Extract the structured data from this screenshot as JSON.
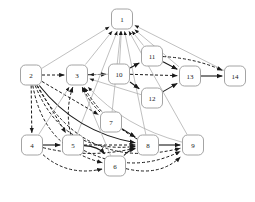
{
  "figure": {
    "title": "",
    "background": "#ffffff",
    "width": 255,
    "height": 202
  },
  "graph_data": {
    "type": "diagram",
    "kind": "directed-graph",
    "node_shape": "rounded-rectangle",
    "node_fill": "#ffffff",
    "node_stroke": "#8d8d8d",
    "node_width": 21,
    "node_height": 20,
    "node_radius": 5,
    "label_color": "#1a1a1a",
    "edge_styles": {
      "solid_dark": {
        "color": "#1a1a1a",
        "dash": "none",
        "width": 1.1
      },
      "dashed_dark": {
        "color": "#1a1a1a",
        "dash": "3,2",
        "width": 1.0
      },
      "solid_gray": {
        "color": "#b0b0b0",
        "dash": "none",
        "width": 0.8
      }
    },
    "nodes": [
      {
        "id": "1",
        "label": "1",
        "x": 122,
        "y": 19
      },
      {
        "id": "2",
        "label": "2",
        "x": 31,
        "y": 75
      },
      {
        "id": "3",
        "label": "3",
        "x": 77,
        "y": 75
      },
      {
        "id": "4",
        "label": "4",
        "x": 32,
        "y": 145
      },
      {
        "id": "5",
        "label": "5",
        "x": 73,
        "y": 145
      },
      {
        "id": "6",
        "label": "6",
        "x": 115,
        "y": 166
      },
      {
        "id": "7",
        "label": "7",
        "x": 111,
        "y": 122
      },
      {
        "id": "8",
        "label": "8",
        "x": 148,
        "y": 145
      },
      {
        "id": "9",
        "label": "9",
        "x": 193,
        "y": 145
      },
      {
        "id": "10",
        "label": "10",
        "x": 119,
        "y": 74
      },
      {
        "id": "11",
        "label": "11",
        "x": 152,
        "y": 56
      },
      {
        "id": "12",
        "label": "12",
        "x": 152,
        "y": 98
      },
      {
        "id": "13",
        "label": "13",
        "x": 190,
        "y": 76
      },
      {
        "id": "14",
        "label": "14",
        "x": 235,
        "y": 76
      }
    ],
    "edges": [
      {
        "from": "2",
        "to": "1",
        "style": "solid_gray",
        "curve": 0
      },
      {
        "from": "3",
        "to": "1",
        "style": "solid_gray",
        "curve": 0
      },
      {
        "from": "10",
        "to": "1",
        "style": "solid_gray",
        "curve": 0
      },
      {
        "from": "11",
        "to": "1",
        "style": "solid_gray",
        "curve": 0
      },
      {
        "from": "13",
        "to": "1",
        "style": "solid_gray",
        "curve": 0
      },
      {
        "from": "14",
        "to": "1",
        "style": "solid_gray",
        "curve": 0
      },
      {
        "from": "7",
        "to": "1",
        "style": "solid_gray",
        "curve": 0
      },
      {
        "from": "8",
        "to": "1",
        "style": "solid_gray",
        "curve": 0
      },
      {
        "from": "9",
        "to": "1",
        "style": "solid_gray",
        "curve": 0
      },
      {
        "from": "5",
        "to": "1",
        "style": "solid_gray",
        "curve": 0
      },
      {
        "from": "2",
        "to": "3",
        "style": "dashed_dark",
        "curve": 0
      },
      {
        "from": "3",
        "to": "10",
        "style": "dashed_dark",
        "curve": 0
      },
      {
        "from": "10",
        "to": "11",
        "style": "solid_dark",
        "curve": 0
      },
      {
        "from": "10",
        "to": "12",
        "style": "solid_dark",
        "curve": 0
      },
      {
        "from": "11",
        "to": "13",
        "style": "solid_dark",
        "curve": 0
      },
      {
        "from": "12",
        "to": "13",
        "style": "solid_dark",
        "curve": 0
      },
      {
        "from": "10",
        "to": "13",
        "style": "dashed_dark",
        "curve": 0
      },
      {
        "from": "13",
        "to": "14",
        "style": "solid_dark",
        "curve": 0
      },
      {
        "from": "11",
        "to": "14",
        "style": "dashed_dark",
        "curve": -8
      },
      {
        "from": "2",
        "to": "4",
        "style": "dashed_dark",
        "curve": 0
      },
      {
        "from": "2",
        "to": "5",
        "style": "dashed_dark",
        "curve": 0
      },
      {
        "from": "2",
        "to": "6",
        "style": "dashed_dark",
        "curve": 40
      },
      {
        "from": "2",
        "to": "7",
        "style": "dashed_dark",
        "curve": 0
      },
      {
        "from": "2",
        "to": "8",
        "style": "solid_dark",
        "curve": 26
      },
      {
        "from": "2",
        "to": "8",
        "style": "dashed_dark",
        "curve": 52
      },
      {
        "from": "2",
        "to": "9",
        "style": "dashed_dark",
        "curve": 68
      },
      {
        "from": "4",
        "to": "5",
        "style": "solid_dark",
        "curve": 0
      },
      {
        "from": "4",
        "to": "3",
        "style": "solid_gray",
        "curve": 0
      },
      {
        "from": "4",
        "to": "8",
        "style": "dashed_dark",
        "curve": 14
      },
      {
        "from": "4",
        "to": "6",
        "style": "dashed_dark",
        "curve": 22
      },
      {
        "from": "5",
        "to": "3",
        "style": "dashed_dark",
        "curve": -10
      },
      {
        "from": "5",
        "to": "6",
        "style": "solid_dark",
        "curve": -10
      },
      {
        "from": "5",
        "to": "8",
        "style": "dashed_dark",
        "curve": 0
      },
      {
        "from": "5",
        "to": "9",
        "style": "dashed_dark",
        "curve": 30
      },
      {
        "from": "6",
        "to": "8",
        "style": "solid_dark",
        "curve": -6
      },
      {
        "from": "6",
        "to": "3",
        "style": "solid_gray",
        "curve": 0
      },
      {
        "from": "6",
        "to": "9",
        "style": "dashed_dark",
        "curve": 22
      },
      {
        "from": "7",
        "to": "3",
        "style": "dashed_dark",
        "curve": -6
      },
      {
        "from": "7",
        "to": "8",
        "style": "solid_dark",
        "curve": 0
      },
      {
        "from": "8",
        "to": "3",
        "style": "dashed_dark",
        "curve": -14
      },
      {
        "from": "8",
        "to": "9",
        "style": "solid_dark",
        "curve": 0
      },
      {
        "from": "9",
        "to": "3",
        "style": "solid_gray",
        "curve": -20
      },
      {
        "from": "10",
        "to": "3",
        "style": "solid_gray",
        "curve": 0
      },
      {
        "from": "12",
        "to": "3",
        "style": "solid_gray",
        "curve": 0
      }
    ]
  }
}
